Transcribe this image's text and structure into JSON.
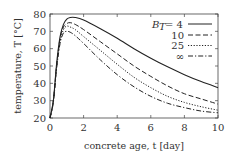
{
  "chart_data": {
    "type": "line",
    "title": "",
    "xlabel": "concrete age, t [day]",
    "ylabel": "temperature, T [°C]",
    "xlim": [
      0,
      10
    ],
    "ylim": [
      20,
      80
    ],
    "xticks": [
      0,
      2,
      4,
      6,
      8,
      10
    ],
    "yticks": [
      20,
      30,
      40,
      50,
      60,
      70,
      80
    ],
    "grid": false,
    "legend_position": "upper right",
    "legend_title": "B_T",
    "x": [
      0,
      0.2,
      0.4,
      0.6,
      0.8,
      1.0,
      1.2,
      1.5,
      2,
      3,
      4,
      5,
      6,
      7,
      8,
      9,
      10
    ],
    "series": [
      {
        "name": "B_T = 4",
        "style": "solid",
        "values": [
          20,
          30,
          52,
          67,
          74,
          77,
          78,
          78,
          76.5,
          71.5,
          66,
          60,
          54.5,
          49.5,
          45,
          41,
          37.5
        ]
      },
      {
        "name": "10",
        "style": "dashed",
        "values": [
          20,
          30,
          51,
          66,
          72.5,
          74.5,
          75,
          74,
          71,
          64,
          57,
          50,
          44,
          38.5,
          34,
          31,
          28
        ]
      },
      {
        "name": "25",
        "style": "dotted",
        "values": [
          20,
          30,
          50,
          64,
          71,
          73,
          72.5,
          71,
          67,
          59,
          51,
          43.5,
          37.5,
          32.5,
          29,
          26.5,
          24.5
        ]
      },
      {
        "name": "∞",
        "style": "dash-dot",
        "values": [
          20,
          29,
          49,
          63,
          69,
          70,
          69.5,
          67.5,
          63,
          53.5,
          45,
          38,
          32.5,
          28.5,
          26,
          24,
          23
        ]
      }
    ]
  },
  "labels": {
    "xlabel": "concrete age, t [day]",
    "ylabel": "temperature, T [°C]",
    "legend": [
      "= 4",
      "10",
      "25",
      "∞"
    ]
  }
}
